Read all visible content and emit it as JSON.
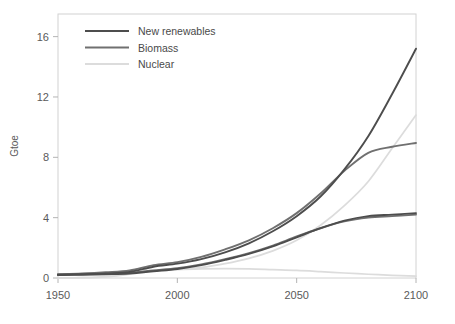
{
  "chart_data": {
    "type": "line",
    "title": "",
    "xlabel": "",
    "ylabel": "Gtoe",
    "xlim": [
      1950,
      2100
    ],
    "ylim": [
      0,
      17.5
    ],
    "xticks": [
      1950,
      2000,
      2050,
      2100
    ],
    "yticks": [
      0,
      4,
      8,
      12,
      16
    ],
    "grid": false,
    "legend_position": "top-left",
    "legend": [
      "New renewables",
      "Biomass",
      "Nuclear"
    ],
    "colors": {
      "new_renewables": "#4d4d4d",
      "biomass": "#707070",
      "nuclear": "#dcdcdc"
    },
    "x": [
      1950,
      1960,
      1970,
      1980,
      1990,
      2000,
      2010,
      2020,
      2030,
      2040,
      2050,
      2060,
      2070,
      2080,
      2090,
      2100
    ],
    "series": [
      {
        "name": "New renewables",
        "scenario": "high",
        "color": "#4d4d4d",
        "values": [
          0.2,
          0.25,
          0.3,
          0.4,
          0.75,
          0.95,
          1.25,
          1.7,
          2.3,
          3.1,
          4.1,
          5.4,
          7.2,
          9.4,
          12.2,
          15.2
        ]
      },
      {
        "name": "New renewables",
        "scenario": "low",
        "color": "#4d4d4d",
        "values": [
          0.2,
          0.22,
          0.25,
          0.3,
          0.45,
          0.6,
          0.85,
          1.2,
          1.6,
          2.1,
          2.7,
          3.3,
          3.8,
          4.1,
          4.2,
          4.3
        ]
      },
      {
        "name": "Biomass",
        "scenario": "high",
        "color": "#707070",
        "values": [
          0.25,
          0.3,
          0.38,
          0.5,
          0.85,
          1.05,
          1.4,
          1.9,
          2.5,
          3.3,
          4.3,
          5.6,
          7.1,
          8.3,
          8.7,
          8.95
        ]
      },
      {
        "name": "Biomass",
        "scenario": "low",
        "color": "#707070",
        "values": [
          0.25,
          0.27,
          0.3,
          0.35,
          0.5,
          0.65,
          0.9,
          1.25,
          1.65,
          2.15,
          2.75,
          3.3,
          3.75,
          4.0,
          4.1,
          4.2
        ]
      },
      {
        "name": "Nuclear",
        "scenario": "high",
        "color": "#dcdcdc",
        "values": [
          0.0,
          0.02,
          0.1,
          0.3,
          0.5,
          0.6,
          0.7,
          0.95,
          1.3,
          1.8,
          2.5,
          3.5,
          4.8,
          6.4,
          8.6,
          10.8
        ]
      },
      {
        "name": "Nuclear",
        "scenario": "low",
        "color": "#dcdcdc",
        "values": [
          0.0,
          0.02,
          0.08,
          0.25,
          0.45,
          0.55,
          0.6,
          0.62,
          0.6,
          0.55,
          0.5,
          0.42,
          0.33,
          0.25,
          0.18,
          0.12
        ]
      }
    ]
  },
  "axes": {
    "y_label": "Gtoe",
    "y_tick_labels": [
      "16",
      "12",
      "8",
      "4",
      "0"
    ],
    "x_tick_labels": [
      "1950",
      "2000",
      "2050",
      "2100"
    ]
  },
  "legend": {
    "items": [
      {
        "label": "New renewables",
        "color": "#4d4d4d"
      },
      {
        "label": "Biomass",
        "color": "#707070"
      },
      {
        "label": "Nuclear",
        "color": "#dcdcdc"
      }
    ]
  }
}
